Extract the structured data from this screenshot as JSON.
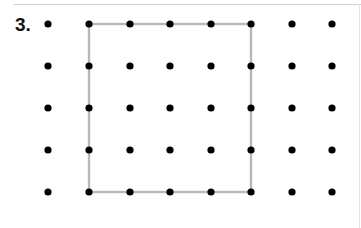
{
  "problem": {
    "number_label": "3."
  },
  "dot_grid": {
    "columns": 8,
    "rows": 5,
    "x_positions": [
      48,
      89,
      130,
      170,
      211,
      251,
      292,
      332
    ],
    "y_positions": [
      24,
      66,
      108,
      150,
      192
    ],
    "dot_radius": 3.6,
    "dot_color": "#000000"
  },
  "square": {
    "from_col": 1,
    "to_col": 5,
    "from_row": 0,
    "to_row": 4,
    "stroke_color": "#b8b8b8",
    "stroke_width": 2.4
  }
}
